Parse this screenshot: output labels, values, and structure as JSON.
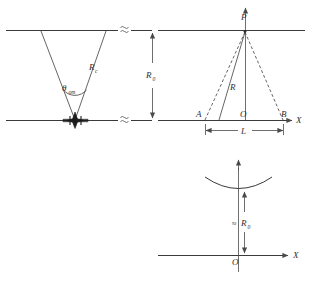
{
  "figure": {
    "background_color": "#ffffff",
    "line_color": "#3a3a3a",
    "text_color": "#2e2e2e"
  },
  "panel_left": {
    "name": "cone-geometry-panel",
    "angle_label": {
      "base": "θ",
      "subscript": "om"
    },
    "radius_label": {
      "base": "R",
      "subscript": "c"
    },
    "break_symbol": "≋",
    "upper_line_label": "upper-boundary-line",
    "lower_line_label": "lower-boundary-line",
    "source_marker": "aircraft-burst-marker"
  },
  "panel_right": {
    "name": "triangulation-panel",
    "apex_label": "P",
    "left_point_label": "A",
    "origin_label": "O",
    "right_point_label": "B",
    "slant_label": "R",
    "baseline_label": "L",
    "axis_label": "X",
    "vertical_dimension": {
      "base": "R",
      "subscript": "0"
    },
    "break_symbol": "≋"
  },
  "panel_bottom": {
    "name": "curved-front-panel",
    "origin_label": "O",
    "axis_label": "X",
    "height_label": {
      "approx": "≈",
      "base": "R",
      "subscript": "0"
    },
    "curve_label": "concave-arc"
  }
}
